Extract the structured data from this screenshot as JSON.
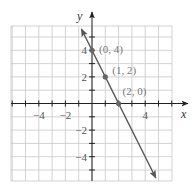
{
  "chart_data": {
    "type": "line",
    "title": "",
    "xlabel": "x",
    "ylabel": "y",
    "xlim": [
      -6,
      6
    ],
    "ylim": [
      -5.8,
      5.8
    ],
    "grid": true,
    "x_ticks": [
      -4,
      -2,
      4
    ],
    "y_ticks": [
      4,
      2,
      -2,
      -4
    ],
    "x_tick_labels": [
      "−4",
      "−2",
      "4"
    ],
    "y_tick_labels": [
      "4",
      "2",
      "−2",
      "−4"
    ],
    "series": [
      {
        "name": "y = -2x + 4",
        "equation": "y = -2x + 4",
        "x": [
          -1,
          5
        ],
        "y": [
          6,
          -6
        ],
        "arrows_both_ends": true
      }
    ],
    "points": [
      {
        "x": 0,
        "y": 4,
        "label": "(0, 4)"
      },
      {
        "x": 1,
        "y": 2,
        "label": "(1, 2)"
      },
      {
        "x": 2,
        "y": 0,
        "label": "(2, 0)"
      }
    ],
    "colors": {
      "grid": "#c8c8c8",
      "axis": "#222222",
      "line": "#555555",
      "point": "#666666",
      "label": "#777777"
    }
  }
}
